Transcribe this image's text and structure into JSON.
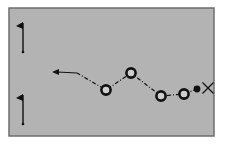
{
  "diagram": {
    "type": "drill-diagram",
    "field": {
      "x": 9,
      "y": 8,
      "width": 205,
      "height": 128,
      "fill": "#b3b3b3",
      "border": "#6e6e6e"
    },
    "flags": [
      {
        "x": 23,
        "top": 23,
        "bottom": 52
      },
      {
        "x": 23,
        "top": 95,
        "bottom": 124
      }
    ],
    "cones": [
      {
        "x": 106,
        "y": 90
      },
      {
        "x": 131,
        "y": 73
      },
      {
        "x": 161,
        "y": 96
      },
      {
        "x": 184,
        "y": 94
      }
    ],
    "ball": {
      "x": 197,
      "y": 89
    },
    "player": {
      "label": "X",
      "x": 208,
      "y": 88
    },
    "path_points": [
      [
        197,
        89
      ],
      [
        184,
        94
      ],
      [
        161,
        96
      ],
      [
        131,
        73
      ],
      [
        106,
        90
      ],
      [
        77,
        73
      ],
      [
        52,
        72
      ]
    ],
    "ink_color": "#111111"
  }
}
